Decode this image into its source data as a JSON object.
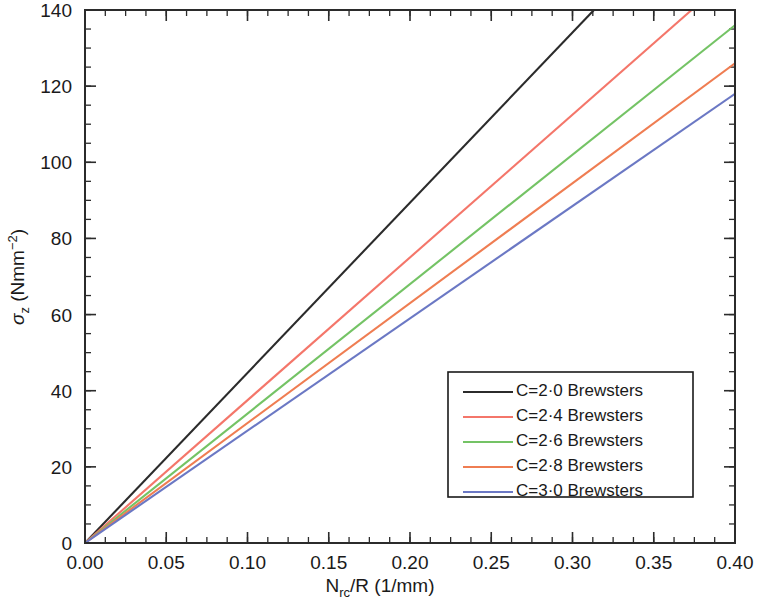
{
  "chart_data": {
    "type": "line",
    "title": "",
    "xlabel": "N_rc/R (1/mm)",
    "xlabel_main": "N",
    "xlabel_sub": "rc",
    "xlabel_rest": "/R (1/mm)",
    "ylabel": "σ_z (Nmm⁻²)",
    "ylabel_sigma": "σ",
    "ylabel_sub": "z",
    "ylabel_rest": " (Nmm",
    "ylabel_sup": "−2",
    "ylabel_close": ")",
    "xlim": [
      0.0,
      0.4
    ],
    "ylim": [
      0,
      140
    ],
    "xticks": [
      0.0,
      0.05,
      0.1,
      0.15,
      0.2,
      0.25,
      0.3,
      0.35,
      0.4
    ],
    "xtick_labels": [
      "0.00",
      "0.05",
      "0.10",
      "0.15",
      "0.20",
      "0.25",
      "0.30",
      "0.35",
      "0.40"
    ],
    "yticks": [
      0,
      20,
      40,
      60,
      80,
      100,
      120,
      140
    ],
    "ytick_labels": [
      "0",
      "20",
      "40",
      "60",
      "80",
      "100",
      "120",
      "140"
    ],
    "x_minor_step": 0.0125,
    "y_minor_step": 5,
    "grid": false,
    "legend_position": "lower-right",
    "series": [
      {
        "name": "C=2·0 Brewsters",
        "color": "#2b2b2b",
        "C": 2.0,
        "slope": 447.0,
        "x": [
          0.0,
          0.3132
        ],
        "values": [
          0.0,
          140.0
        ]
      },
      {
        "name": "C=2·4 Brewsters",
        "color": "#f4766a",
        "C": 2.4,
        "slope": 375.0,
        "x": [
          0.0,
          0.3733
        ],
        "values": [
          0.0,
          140.0
        ]
      },
      {
        "name": "C=2·6 Brewsters",
        "color": "#74c365",
        "C": 2.6,
        "slope": 340.0,
        "x": [
          0.0,
          0.4
        ],
        "values": [
          0.0,
          136.0
        ]
      },
      {
        "name": "C=2·8 Brewsters",
        "color": "#ef7d52",
        "C": 2.8,
        "slope": 315.0,
        "x": [
          0.0,
          0.4
        ],
        "values": [
          0.0,
          126.0
        ]
      },
      {
        "name": "C=3·0 Brewsters",
        "color": "#6b78c4",
        "C": 3.0,
        "slope": 295.0,
        "x": [
          0.0,
          0.4
        ],
        "values": [
          0.0,
          118.0
        ]
      }
    ]
  },
  "legend": {
    "items": [
      {
        "label": "C=2·0 Brewsters",
        "color": "#2b2b2b"
      },
      {
        "label": "C=2·4 Brewsters",
        "color": "#f4766a"
      },
      {
        "label": "C=2·6 Brewsters",
        "color": "#74c365"
      },
      {
        "label": "C=2·8 Brewsters",
        "color": "#ef7d52"
      },
      {
        "label": "C=3·0 Brewsters",
        "color": "#6b78c4"
      }
    ]
  }
}
